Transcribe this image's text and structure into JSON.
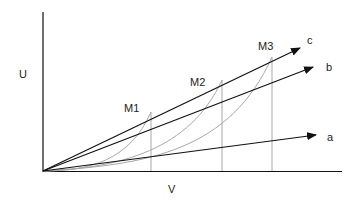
{
  "diagram": {
    "axes": {
      "y_label": "U",
      "x_label": "V"
    },
    "rays": [
      {
        "id": "a",
        "label": "a"
      },
      {
        "id": "b",
        "label": "b"
      },
      {
        "id": "c",
        "label": "c"
      }
    ],
    "points": [
      {
        "id": "M1",
        "label": "M1"
      },
      {
        "id": "M2",
        "label": "M2"
      },
      {
        "id": "M3",
        "label": "M3"
      }
    ],
    "colors": {
      "rays": "#111111",
      "curves": "#a8a8a8",
      "axes": "#111111"
    }
  }
}
